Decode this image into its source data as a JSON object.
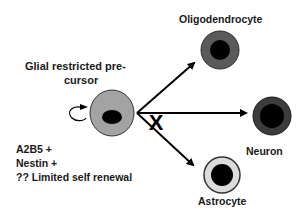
{
  "precursor": {
    "title_line1": "Glial restricted pre-",
    "title_line2": "cursor",
    "markers": [
      "A2B5 +",
      "Nestin +",
      "?? Limited self renewal"
    ]
  },
  "fates": {
    "oligodendrocyte": "Oligodendrocyte",
    "neuron": "Neuron",
    "astrocyte": "Astrocyte"
  },
  "blocked_symbol": "X",
  "colors": {
    "precursor_fill": "#a3a3a3",
    "oligodendrocyte_fill": "#5a5a5a",
    "neuron_fill": "#3c3c3c",
    "astrocyte_fill": "#dcdcdc",
    "nucleus": "#000000"
  }
}
